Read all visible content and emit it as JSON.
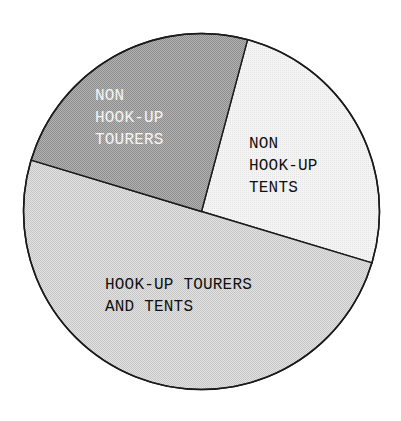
{
  "chart_data": {
    "type": "pie",
    "title": "",
    "start_angle_deg_clockwise_from_top": 15,
    "center": [
      201.5,
      211.5
    ],
    "radius": 178,
    "categories": [
      "NON HOOK-UP TENTS",
      "HOOK-UP TOURERS AND TENTS",
      "NON HOOK-UP TOURERS"
    ],
    "values": [
      25.5,
      50.0,
      24.5
    ],
    "unit": "percent (estimated from wedge angles)",
    "slices": [
      {
        "name": "non-hook-up-tents",
        "label_lines": [
          "NON",
          "HOOK-UP",
          "TENTS"
        ],
        "value": 25.5,
        "fill": "#efefef",
        "pattern": "fine-dot-light",
        "text_color": "#111111",
        "label_x": 249,
        "label_y": 148
      },
      {
        "name": "hook-up-tourers-and-tents",
        "label_lines": [
          "HOOK-UP TOURERS",
          "AND TENTS"
        ],
        "value": 50.0,
        "fill": "#d9d9d9",
        "pattern": "fine-dot-medium",
        "text_color": "#111111",
        "label_x": 105,
        "label_y": 289
      },
      {
        "name": "non-hook-up-tourers",
        "label_lines": [
          "NON",
          "HOOK-UP",
          "TOURERS"
        ],
        "value": 24.5,
        "fill": "#a9a9a9",
        "pattern": "checker-dark",
        "text_color": "#f4f4f4",
        "label_x": 95,
        "label_y": 100
      }
    ],
    "legend": "none (labels drawn inside wedges)",
    "grid": false
  }
}
